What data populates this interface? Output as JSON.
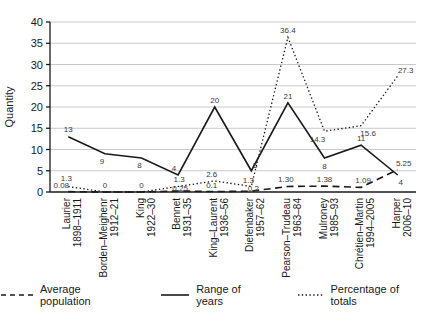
{
  "figure": {
    "background": "#ffffff"
  },
  "legend": [
    {
      "label": "Average population"
    },
    {
      "label": "Range of years"
    },
    {
      "label": "Percentage of totals"
    }
  ],
  "chart_data": {
    "type": "line",
    "title": "",
    "xlabel": "",
    "ylabel": "Quantity",
    "ylim": [
      0,
      40
    ],
    "yticks": [
      0,
      5,
      10,
      15,
      20,
      25,
      30,
      35,
      40
    ],
    "grid": true,
    "legend_position": "bottom",
    "categories": [
      {
        "name": "Laurier",
        "years": "1898–1911"
      },
      {
        "name": "Borden–Meighenr",
        "years": "1912–21"
      },
      {
        "name": "King",
        "years": "1922–30"
      },
      {
        "name": "Bennet",
        "years": "1931–35"
      },
      {
        "name": "King–Laurent",
        "years": "1936–56"
      },
      {
        "name": "Diefenbaker",
        "years": "1957–62"
      },
      {
        "name": "Pearson–Trudeau",
        "years": "1963–84"
      },
      {
        "name": "Mulroney",
        "years": "1985–93"
      },
      {
        "name": "Chrétien–Martin",
        "years": "1994–2005"
      },
      {
        "name": "Harper",
        "years": "2006–10"
      }
    ],
    "series": [
      {
        "name": "Average population",
        "style": "dashed",
        "values": [
          0.08,
          0,
          0,
          0.25,
          0.1,
          0.2,
          1.3,
          1.38,
          1.09,
          5.25
        ],
        "labels": [
          "0.08",
          "",
          "",
          "0.25",
          "0.1",
          "0.2",
          "1.30",
          "1.38",
          "1.09",
          "5.25"
        ],
        "label_offset": [
          [
            -7,
            -4
          ],
          [
            0,
            0
          ],
          [
            0,
            0
          ],
          [
            2,
            0
          ],
          [
            -3,
            -4
          ],
          [
            2,
            0
          ],
          [
            -2,
            -4
          ],
          [
            0,
            -4
          ],
          [
            2,
            -4
          ],
          [
            6,
            -4
          ]
        ]
      },
      {
        "name": "Range of years",
        "style": "solid",
        "values": [
          13,
          9,
          8,
          4,
          20,
          5,
          21,
          8,
          11,
          4
        ],
        "labels": [
          "13",
          "9",
          "8",
          "4",
          "20",
          "5",
          "21",
          "8",
          "11",
          "4"
        ],
        "label_offset": [
          [
            0,
            -5
          ],
          [
            -3,
            10
          ],
          [
            -2,
            10
          ],
          [
            -4,
            -4
          ],
          [
            0,
            -4
          ],
          [
            4,
            -3
          ],
          [
            0,
            -4
          ],
          [
            0,
            11
          ],
          [
            0,
            -4
          ],
          [
            3,
            10
          ]
        ]
      },
      {
        "name": "Percentage of totals",
        "style": "dotted",
        "values": [
          1.3,
          0,
          0,
          1.3,
          2.6,
          1.3,
          36.4,
          14.3,
          15.6,
          27.3
        ],
        "labels": [
          "1.3",
          "0",
          "0",
          "1.3",
          "2.6",
          "1.3",
          "36.4",
          "14.3",
          "15.6",
          "27.3"
        ],
        "label_offset": [
          [
            -2,
            -5
          ],
          [
            0,
            -4
          ],
          [
            0,
            -4
          ],
          [
            1,
            -4
          ],
          [
            -3,
            -4
          ],
          [
            -3,
            -3
          ],
          [
            0,
            -4
          ],
          [
            -7,
            11
          ],
          [
            7,
            10
          ],
          [
            8,
            -3
          ]
        ]
      }
    ],
    "colors": {
      "line": "#1a1a1a",
      "grid": "#c9c9c9",
      "label": "#3a3a3a"
    }
  }
}
